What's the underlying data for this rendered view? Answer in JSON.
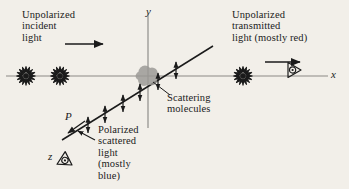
{
  "figure": {
    "background_color": "#f2efe9",
    "ink_color": "#1b1b1b",
    "width": 349,
    "height": 189
  },
  "labels": {
    "incident": "Unpolarized\nincident\nlight",
    "transmitted": "Unpolarized\ntransmitted\nlight (mostly red)",
    "scattering": "Scattering\nmolecules",
    "polarized": "Polarized\nscattered\nlight\n(mostly\nblue)",
    "axis_y": "y",
    "axis_x": "x",
    "axis_z": "z",
    "point_p": "P"
  },
  "icons": {
    "unpolarized_left_1": "unpolarized-light-starburst-icon",
    "unpolarized_left_2": "unpolarized-light-starburst-icon",
    "unpolarized_right": "unpolarized-light-starburst-icon",
    "incident_direction": "right-arrow-icon",
    "transmitted_direction": "right-arrow-icon",
    "eye_x_axis": "eye-icon",
    "eye_z_axis": "eye-icon",
    "scattered_direction": "down-left-arrow-icon",
    "polarization_arrows": "vertical-double-arrow-icon"
  },
  "geometry": {
    "origin": {
      "x": 148,
      "y": 76
    },
    "x_axis": {
      "x1": 6,
      "y1": 76,
      "x2": 328,
      "y2": 76
    },
    "y_axis": {
      "x1": 148,
      "y1": 14,
      "x2": 148,
      "y2": 128
    },
    "z_axis": {
      "x1": 62,
      "y1": 140,
      "x2": 213,
      "y2": 46
    },
    "molecule_blob": {
      "cx": 148,
      "cy": 76,
      "r": 11,
      "color": "#9a9894"
    },
    "leader_line": {
      "x1": 152,
      "y1": 81,
      "x2": 170,
      "y2": 95
    }
  }
}
